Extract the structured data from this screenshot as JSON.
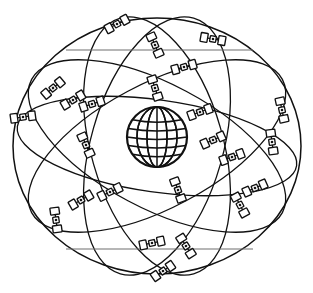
{
  "figure": {
    "background_color": "#ffffff",
    "line_color": "#111111",
    "chord_color": "#6f6f6f",
    "width": 313,
    "height": 293
  },
  "earth": {
    "label": "Earth",
    "center_x": 157,
    "center_y": 137,
    "radius": 30,
    "meridian_count": 5,
    "parallel_count": 5,
    "fill": "#ffffff",
    "stroke": "#111111"
  },
  "orbits": {
    "count": 6,
    "center_x": 157,
    "center_y": 146,
    "planes": [
      {
        "name": "orbit-plane-1",
        "rx": 144,
        "ry": 128,
        "rotation": 0
      },
      {
        "name": "orbit-plane-2",
        "rx": 142,
        "ry": 62,
        "rotation": 28
      },
      {
        "name": "orbit-plane-3",
        "rx": 142,
        "ry": 62,
        "rotation": -28
      },
      {
        "name": "orbit-plane-4",
        "rx": 141,
        "ry": 46,
        "rotation": 8
      },
      {
        "name": "orbit-plane-5",
        "rx": 66,
        "ry": 133,
        "rotation": 16
      },
      {
        "name": "orbit-plane-6",
        "rx": 66,
        "ry": 133,
        "rotation": -16
      }
    ]
  },
  "chords": [
    {
      "name": "chord-upper",
      "x1": 66,
      "y1": 50,
      "x2": 253,
      "y2": 50
    },
    {
      "name": "chord-lower",
      "x1": 66,
      "y1": 249,
      "x2": 253,
      "y2": 249
    }
  ],
  "satellites": {
    "count": 24,
    "icon_name": "satellite-icon",
    "panel_width": 7,
    "panel_height": 9,
    "items": [
      {
        "id": "sat-01",
        "x": 117,
        "y": 24,
        "angle": -28
      },
      {
        "id": "sat-02",
        "x": 213,
        "y": 39,
        "angle": 10
      },
      {
        "id": "sat-03",
        "x": 184,
        "y": 67,
        "angle": -16
      },
      {
        "id": "sat-04",
        "x": 53,
        "y": 88,
        "angle": -40
      },
      {
        "id": "sat-05",
        "x": 73,
        "y": 100,
        "angle": -30
      },
      {
        "id": "sat-06",
        "x": 92,
        "y": 104,
        "angle": -18
      },
      {
        "id": "sat-07",
        "x": 23,
        "y": 117,
        "angle": -8
      },
      {
        "id": "sat-08",
        "x": 155,
        "y": 88,
        "angle": 72
      },
      {
        "id": "sat-09",
        "x": 282,
        "y": 110,
        "angle": 78
      },
      {
        "id": "sat-10",
        "x": 86,
        "y": 145,
        "angle": 66
      },
      {
        "id": "sat-11",
        "x": 213,
        "y": 140,
        "angle": -24
      },
      {
        "id": "sat-12",
        "x": 232,
        "y": 157,
        "angle": -20
      },
      {
        "id": "sat-13",
        "x": 272,
        "y": 142,
        "angle": 82
      },
      {
        "id": "sat-14",
        "x": 110,
        "y": 192,
        "angle": -26
      },
      {
        "id": "sat-15",
        "x": 81,
        "y": 200,
        "angle": -30
      },
      {
        "id": "sat-16",
        "x": 178,
        "y": 190,
        "angle": 70
      },
      {
        "id": "sat-17",
        "x": 255,
        "y": 188,
        "angle": -24
      },
      {
        "id": "sat-18",
        "x": 56,
        "y": 220,
        "angle": 82
      },
      {
        "id": "sat-19",
        "x": 152,
        "y": 243,
        "angle": -12
      },
      {
        "id": "sat-20",
        "x": 186,
        "y": 246,
        "angle": 58
      },
      {
        "id": "sat-21",
        "x": 163,
        "y": 271,
        "angle": -34
      },
      {
        "id": "sat-22",
        "x": 155,
        "y": 45,
        "angle": 66
      },
      {
        "id": "sat-23",
        "x": 240,
        "y": 205,
        "angle": 62
      },
      {
        "id": "sat-24",
        "x": 200,
        "y": 112,
        "angle": -20
      }
    ]
  }
}
